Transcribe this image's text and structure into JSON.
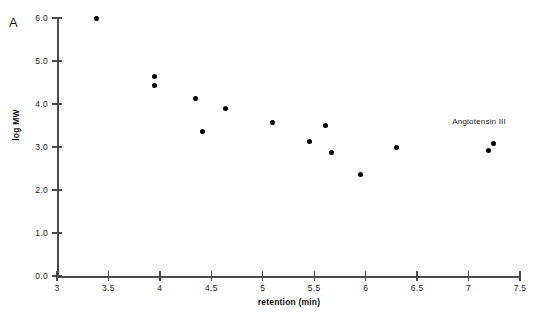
{
  "panel": {
    "label": "A"
  },
  "chart_data": {
    "type": "scatter",
    "title": "",
    "xlabel": "retention (min)",
    "ylabel": "log MW",
    "xlim": [
      3,
      7.5
    ],
    "ylim": [
      0.0,
      6.0
    ],
    "grid": false,
    "legend": "none",
    "xticks": [
      "3",
      "3.5",
      "4",
      "4.5",
      "5",
      "5.5",
      "6",
      "6.5",
      "7",
      "7.5"
    ],
    "xtick_values": [
      3,
      3.5,
      4,
      4.5,
      5,
      5.5,
      6,
      6.5,
      7,
      7.5
    ],
    "yticks": [
      "0.0",
      "1.0",
      "2.0",
      "3.0",
      "4.0",
      "5.0",
      "6.0"
    ],
    "ytick_values": [
      0.0,
      1.0,
      2.0,
      3.0,
      4.0,
      5.0,
      6.0
    ],
    "marker": "filled-circle",
    "marker_color": "#000000",
    "axis_color": "#4a4a4a",
    "points": [
      {
        "x": 3.38,
        "y": 6.0
      },
      {
        "x": 3.95,
        "y": 4.63
      },
      {
        "x": 3.95,
        "y": 4.44
      },
      {
        "x": 4.35,
        "y": 4.12
      },
      {
        "x": 4.41,
        "y": 3.37
      },
      {
        "x": 4.64,
        "y": 3.9
      },
      {
        "x": 5.09,
        "y": 3.56
      },
      {
        "x": 5.45,
        "y": 3.12
      },
      {
        "x": 5.61,
        "y": 3.51
      },
      {
        "x": 5.67,
        "y": 2.88
      },
      {
        "x": 5.95,
        "y": 2.35
      },
      {
        "x": 6.3,
        "y": 2.98
      },
      {
        "x": 7.19,
        "y": 2.91
      },
      {
        "x": 7.24,
        "y": 3.09
      }
    ],
    "annotations": [
      {
        "text": "Angiotensin III",
        "x": 7.25,
        "y": 3.55
      }
    ]
  }
}
